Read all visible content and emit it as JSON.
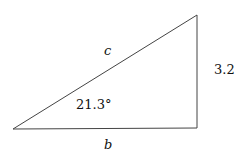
{
  "diagram": {
    "type": "right-triangle",
    "labels": {
      "hypotenuse": "c",
      "opposite_side": "3.2",
      "adjacent_side": "b",
      "angle": "21.3°"
    },
    "stroke_color": "#444444"
  }
}
